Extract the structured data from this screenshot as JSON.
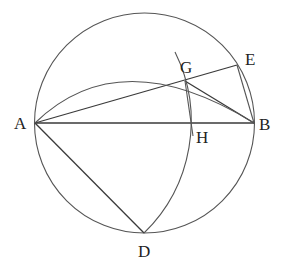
{
  "diagram": {
    "type": "geometry-construction",
    "points": {
      "A": {
        "label": "A",
        "x": 35,
        "y": 123,
        "label_x": 14,
        "label_y": 129
      },
      "B": {
        "label": "B",
        "x": 254,
        "y": 123,
        "label_x": 259,
        "label_y": 130
      },
      "G": {
        "label": "G",
        "x": 185,
        "y": 81,
        "label_x": 181,
        "label_y": 72
      },
      "E": {
        "label": "E",
        "x": 237,
        "y": 65,
        "label_x": 243,
        "label_y": 64
      },
      "H": {
        "label": "H",
        "x": 192,
        "y": 123,
        "label_x": 196,
        "label_y": 142
      },
      "D": {
        "label": "D",
        "x": 144,
        "y": 233,
        "label_x": 138,
        "label_y": 256
      }
    },
    "circle": {
      "cx": 144.5,
      "cy": 123,
      "r": 110
    },
    "colors": {
      "stroke": "#3a3a3a",
      "label": "#222222",
      "background": "#ffffff"
    }
  }
}
